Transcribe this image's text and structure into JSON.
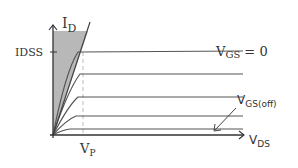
{
  "diagram": {
    "labels": {
      "y_axis": "I",
      "y_axis_sub": "D",
      "idss": "IDSS",
      "vgs0_main": "V",
      "vgs0_sub": "GS",
      "vgs0_eq": " = 0",
      "vgsoff_main": "V",
      "vgsoff_sub": "GS(off)",
      "vp_main": "V",
      "vp_sub": "P",
      "x_axis": "V",
      "x_axis_sub": "DS"
    },
    "colors": {
      "line": "#555555",
      "shade": "#b8b8b8",
      "dashed": "#bbbbbb"
    },
    "curves": [
      {
        "name": "VGS = 0",
        "y": 52
      },
      {
        "name": "curve-2",
        "y": 74
      },
      {
        "name": "curve-3",
        "y": 97
      },
      {
        "name": "curve-4",
        "y": 116
      },
      {
        "name": "VGS(off)",
        "y": 129
      }
    ]
  }
}
